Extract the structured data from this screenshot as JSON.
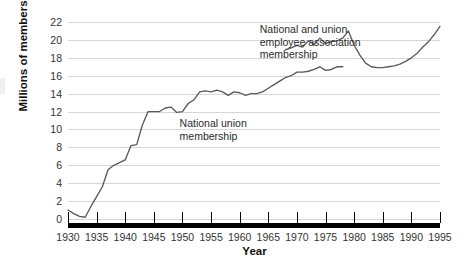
{
  "chart_data": {
    "type": "line",
    "title": "",
    "xlabel": "Year",
    "ylabel": "Millions of members",
    "xlim": [
      1930,
      1995
    ],
    "ylim": [
      0,
      22
    ],
    "grid": true,
    "legend_position": "inline-annotations",
    "xticks": [
      1930,
      1935,
      1940,
      1945,
      1950,
      1955,
      1960,
      1965,
      1970,
      1975,
      1980,
      1985,
      1990,
      1995
    ],
    "yticks": [
      0,
      2,
      4,
      6,
      8,
      10,
      12,
      14,
      16,
      18,
      20,
      22
    ],
    "annotations": [
      {
        "name": "national-union-membership",
        "text": "National union\nmembership",
        "x": 1949.5,
        "y": 11.4
      },
      {
        "name": "national-and-union-employee-association-membership",
        "text": "National and union\nemployee association\nmembership",
        "x": 1963.5,
        "y": 21.9
      }
    ],
    "series": [
      {
        "name": "National union membership",
        "color": "#5a5a5a",
        "x": [
          1930,
          1931,
          1932,
          1933,
          1934,
          1935,
          1936,
          1937,
          1938,
          1939,
          1940,
          1941,
          1942,
          1943,
          1944,
          1945,
          1946,
          1947,
          1948,
          1949,
          1950,
          1951,
          1952,
          1953,
          1954,
          1955,
          1956,
          1957,
          1958,
          1959,
          1960,
          1961,
          1962,
          1963,
          1964,
          1965,
          1966,
          1967,
          1968,
          1969,
          1970,
          1971,
          1972,
          1973,
          1974,
          1975,
          1976,
          1977,
          1978
        ],
        "values": [
          1.0,
          0.6,
          0.3,
          0.2,
          1.4,
          2.5,
          3.6,
          5.5,
          6.0,
          6.3,
          6.6,
          8.2,
          8.3,
          10.5,
          12.0,
          12.0,
          12.0,
          12.4,
          12.5,
          11.9,
          12.0,
          12.9,
          13.3,
          14.2,
          14.3,
          14.2,
          14.4,
          14.2,
          13.8,
          14.2,
          14.1,
          13.8,
          14.0,
          14.0,
          14.2,
          14.6,
          15.0,
          15.4,
          15.8,
          16.0,
          16.4,
          16.4,
          16.5,
          16.7,
          17.0,
          16.6,
          16.7,
          17.0,
          17.0
        ]
      },
      {
        "name": "National and union employee association membership",
        "color": "#5a5a5a",
        "x": [
          1968,
          1969,
          1970,
          1971,
          1972,
          1973,
          1974,
          1975,
          1976,
          1977,
          1978,
          1979,
          1980,
          1981,
          1982,
          1983,
          1984,
          1985,
          1986,
          1987,
          1988,
          1989,
          1990,
          1991,
          1992,
          1993,
          1994,
          1995
        ],
        "values": [
          18.9,
          19.1,
          19.4,
          19.2,
          19.9,
          19.5,
          20.2,
          19.6,
          19.8,
          19.9,
          20.2,
          21.0,
          19.4,
          18.3,
          17.4,
          17.0,
          16.9,
          16.9,
          17.0,
          17.1,
          17.3,
          17.6,
          18.0,
          18.5,
          19.2,
          19.8,
          20.6,
          21.5
        ]
      }
    ]
  }
}
